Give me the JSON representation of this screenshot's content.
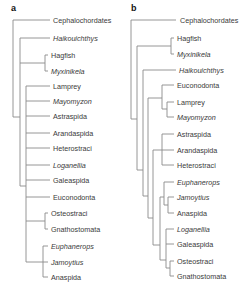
{
  "panels": {
    "a": {
      "label": "a",
      "taxa": [
        {
          "name": "Cephalochordates",
          "italic": false
        },
        {
          "name": "Haikouichthys",
          "italic": true
        },
        {
          "name": "Hagfish",
          "italic": false
        },
        {
          "name": "Myxinikela",
          "italic": true
        },
        {
          "name": "Lamprey",
          "italic": false
        },
        {
          "name": "Mayomyzon",
          "italic": true
        },
        {
          "name": "Astraspida",
          "italic": false
        },
        {
          "name": "Arandaspida",
          "italic": false
        },
        {
          "name": "Heterostraci",
          "italic": false
        },
        {
          "name": "Loganellia",
          "italic": true
        },
        {
          "name": "Galeaspida",
          "italic": false
        },
        {
          "name": "Euconodonta",
          "italic": false
        },
        {
          "name": "Osteostraci",
          "italic": false
        },
        {
          "name": "Gnathostomata",
          "italic": false
        },
        {
          "name": "Euphanerops",
          "italic": true
        },
        {
          "name": "Jamoytius",
          "italic": true
        },
        {
          "name": "Anaspida",
          "italic": false
        }
      ]
    },
    "b": {
      "label": "b",
      "taxa": [
        {
          "name": "Cephalochordates",
          "italic": false
        },
        {
          "name": "Hagfish",
          "italic": false
        },
        {
          "name": "Myxinikela",
          "italic": true
        },
        {
          "name": "Haikouichthys",
          "italic": true
        },
        {
          "name": "Euconodonta",
          "italic": false
        },
        {
          "name": "Lamprey",
          "italic": false
        },
        {
          "name": "Mayomyzon",
          "italic": true
        },
        {
          "name": "Astraspida",
          "italic": false
        },
        {
          "name": "Arandaspida",
          "italic": false
        },
        {
          "name": "Heterostraci",
          "italic": false
        },
        {
          "name": "Euphanerops",
          "italic": true
        },
        {
          "name": "Jamoytius",
          "italic": true
        },
        {
          "name": "Anaspida",
          "italic": false
        },
        {
          "name": "Loganellia",
          "italic": true
        },
        {
          "name": "Galeaspida",
          "italic": false
        },
        {
          "name": "Osteostraci",
          "italic": false
        },
        {
          "name": "Gnathostomata",
          "italic": false
        }
      ]
    }
  }
}
